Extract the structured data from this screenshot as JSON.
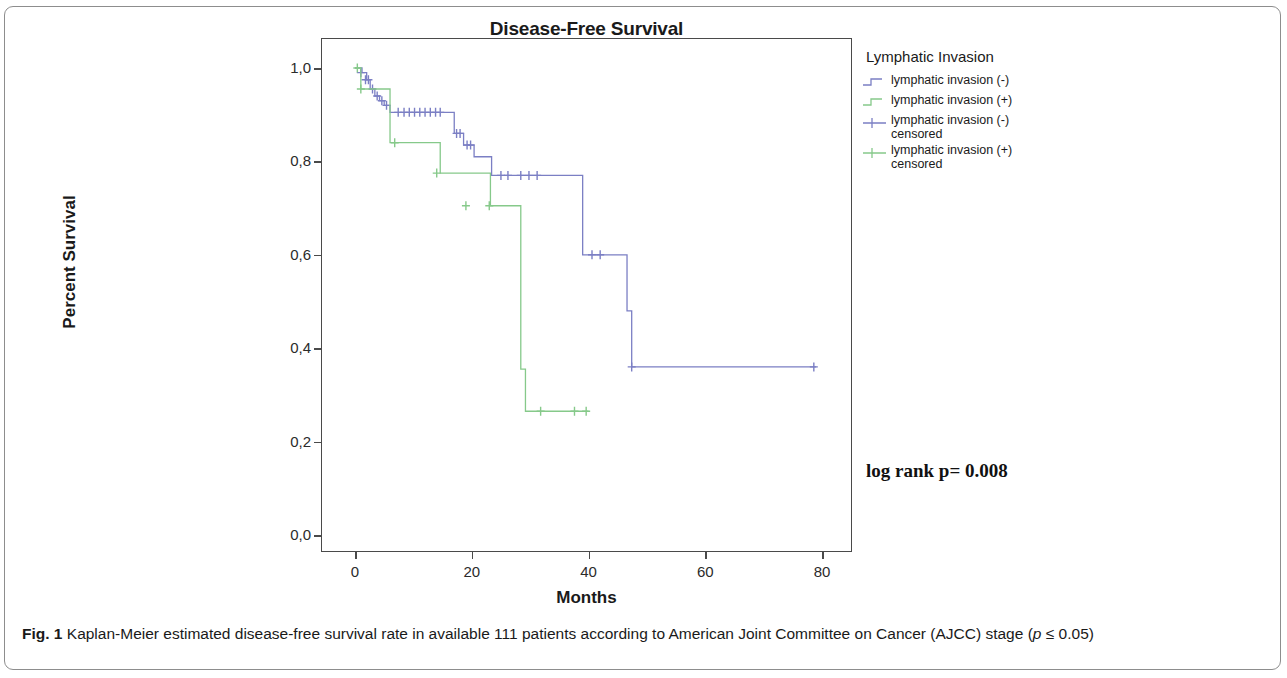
{
  "figure": {
    "caption_label": "Fig. 1",
    "caption_text": " Kaplan-Meier estimated disease-free survival rate in available 111 patients according to American Joint Committee on Cancer (AJCC) stage (",
    "caption_italic_p": "p",
    "caption_tail": " ≤ 0.05)"
  },
  "annotation": {
    "log_rank": "log rank p= 0.008"
  },
  "legend": {
    "title": "Lymphatic Invasion",
    "items": [
      {
        "label": "lymphatic invasion (-)",
        "type": "step",
        "color": "#7b7fc4"
      },
      {
        "label": "lymphatic invasion (+)",
        "type": "step",
        "color": "#86c98a"
      },
      {
        "label": "lymphatic invasion (-)\ncensored",
        "type": "censor",
        "color": "#7b7fc4"
      },
      {
        "label": "lymphatic invasion (+)\ncensored",
        "type": "censor",
        "color": "#86c98a"
      }
    ]
  },
  "chart_data": {
    "type": "line",
    "subtype": "kaplan-meier-step",
    "title": "Disease-Free Survival",
    "xlabel": "Months",
    "ylabel": "Percent Survival",
    "xlim": [
      -3,
      83
    ],
    "ylim": [
      0.0,
      1.04
    ],
    "grid": false,
    "legend_position": "right",
    "xticks": [
      0,
      20,
      40,
      60,
      80
    ],
    "xtick_labels": [
      "0",
      "20",
      "40",
      "60",
      "80"
    ],
    "yticks": [
      0.0,
      0.2,
      0.4,
      0.6,
      0.8,
      1.0
    ],
    "ytick_labels": [
      "0,0",
      "0,2",
      "0,4",
      "0,6",
      "0,8",
      "1,0"
    ],
    "decimal_separator": ",",
    "series": [
      {
        "name": "lymphatic invasion (-)",
        "color": "#7b7fc4",
        "steps_x": [
          0,
          1.2,
          2.0,
          2.6,
          3.4,
          4.2,
          5.0,
          6.0,
          17.0,
          18.6,
          20.4,
          23.4,
          38.2,
          39.0,
          46.6,
          47.4,
          79.0
        ],
        "steps_y": [
          1.0,
          0.99,
          0.975,
          0.955,
          0.94,
          0.93,
          0.92,
          0.905,
          0.86,
          0.835,
          0.81,
          0.77,
          0.77,
          0.6,
          0.48,
          0.36,
          0.36
        ],
        "censored_x": [
          1.0,
          1.8,
          2.3,
          3.0,
          3.8,
          4.6,
          5.4,
          7.4,
          8.4,
          9.3,
          10.2,
          11.1,
          12.0,
          12.9,
          13.8,
          14.6,
          17.4,
          18.0,
          19.2,
          19.8,
          25.0,
          26.2,
          28.4,
          29.8,
          31.2,
          40.6,
          42.0,
          47.4,
          78.6
        ],
        "censored_y": [
          0.99,
          0.975,
          0.975,
          0.955,
          0.94,
          0.93,
          0.92,
          0.905,
          0.905,
          0.905,
          0.905,
          0.905,
          0.905,
          0.905,
          0.905,
          0.905,
          0.86,
          0.86,
          0.835,
          0.835,
          0.77,
          0.77,
          0.77,
          0.77,
          0.77,
          0.6,
          0.6,
          0.36,
          0.36
        ]
      },
      {
        "name": "lymphatic invasion (+)",
        "color": "#86c98a",
        "steps_x": [
          0,
          1.0,
          5.2,
          6.0,
          11.8,
          14.6,
          23.2,
          24.0,
          28.4,
          29.2,
          40.0
        ],
        "steps_y": [
          1.0,
          0.955,
          0.955,
          0.84,
          0.84,
          0.775,
          0.705,
          0.705,
          0.355,
          0.265,
          0.265
        ],
        "censored_x": [
          0.4,
          1.0,
          6.8,
          14.0,
          19.0,
          23.0,
          31.8,
          37.6,
          39.6
        ],
        "censored_y": [
          1.0,
          0.955,
          0.84,
          0.775,
          0.705,
          0.705,
          0.265,
          0.265,
          0.265
        ]
      }
    ]
  }
}
